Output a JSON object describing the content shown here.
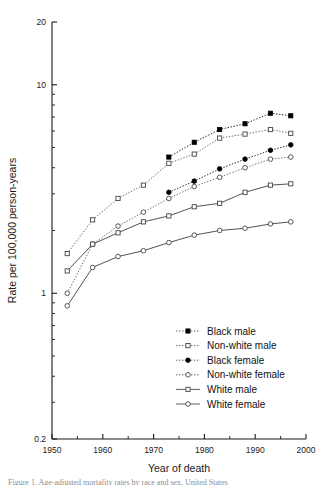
{
  "figure": {
    "caption_partial": "Figure 1. Age-adjusted mortality rates by race and sex, United States"
  },
  "chart_data": {
    "type": "line",
    "title": "",
    "xlabel": "Year of death",
    "ylabel": "Rate per 100,000 person-years",
    "yscale": "log",
    "xscale": "linear",
    "xlim": [
      1950,
      2000
    ],
    "ylim": [
      0.2,
      20
    ],
    "grid": false,
    "legend_position": "lower-right-inside",
    "xticks": [
      1950,
      1960,
      1970,
      1980,
      1990,
      2000
    ],
    "xtick_labels": [
      "1950",
      "1960",
      "1970",
      "1980",
      "1990",
      "2000"
    ],
    "xminor_ticks": [
      1955,
      1965,
      1975,
      1985,
      1995
    ],
    "yticks": [
      0.2,
      1,
      10,
      20
    ],
    "ytick_labels": [
      "0.2",
      "1",
      "10",
      "20"
    ],
    "yminor_ticks": [
      0.3,
      0.4,
      0.5,
      0.6,
      0.7,
      0.8,
      0.9,
      2,
      3,
      4,
      5,
      6,
      7,
      8,
      9
    ],
    "series": [
      {
        "name": "Black male",
        "marker": "filled-square",
        "line": "dotted",
        "color": "#000000",
        "x": [
          1973,
          1978,
          1983,
          1988,
          1993,
          1997
        ],
        "y": [
          4.5,
          5.3,
          6.1,
          6.5,
          7.3,
          7.1
        ]
      },
      {
        "name": "Non-white male",
        "marker": "open-square",
        "line": "dotted",
        "color": "#555555",
        "x": [
          1953,
          1958,
          1963,
          1968,
          1973,
          1978,
          1983,
          1988,
          1993,
          1997
        ],
        "y": [
          1.55,
          2.25,
          2.85,
          3.3,
          4.2,
          4.65,
          5.55,
          5.8,
          6.1,
          5.85
        ]
      },
      {
        "name": "Black female",
        "marker": "filled-circle",
        "line": "dotted",
        "color": "#000000",
        "x": [
          1973,
          1978,
          1983,
          1988,
          1993,
          1997
        ],
        "y": [
          3.05,
          3.45,
          3.95,
          4.4,
          4.85,
          5.15
        ]
      },
      {
        "name": "Non-white female",
        "marker": "open-circle",
        "line": "dotted",
        "color": "#555555",
        "x": [
          1953,
          1958,
          1963,
          1968,
          1973,
          1978,
          1983,
          1988,
          1993,
          1997
        ],
        "y": [
          1.0,
          1.72,
          2.1,
          2.45,
          2.85,
          3.25,
          3.6,
          4.0,
          4.4,
          4.5
        ]
      },
      {
        "name": "White male",
        "marker": "open-square",
        "line": "solid",
        "color": "#333333",
        "x": [
          1953,
          1958,
          1963,
          1968,
          1973,
          1978,
          1983,
          1988,
          1993,
          1997
        ],
        "y": [
          1.28,
          1.72,
          1.95,
          2.2,
          2.35,
          2.6,
          2.7,
          3.05,
          3.3,
          3.35
        ]
      },
      {
        "name": "White female",
        "marker": "open-circle",
        "line": "solid",
        "color": "#333333",
        "x": [
          1953,
          1958,
          1963,
          1968,
          1973,
          1978,
          1983,
          1988,
          1993,
          1997
        ],
        "y": [
          0.87,
          1.33,
          1.5,
          1.6,
          1.75,
          1.9,
          2.0,
          2.05,
          2.15,
          2.2
        ]
      }
    ],
    "legend_entries": [
      {
        "label": "Black male",
        "marker": "filled-square",
        "line": "dotted"
      },
      {
        "label": "Non-white male",
        "marker": "open-square",
        "line": "dotted"
      },
      {
        "label": "Black female",
        "marker": "filled-circle",
        "line": "dotted"
      },
      {
        "label": "Non-white female",
        "marker": "open-circle",
        "line": "dotted"
      },
      {
        "label": "White male",
        "marker": "open-square",
        "line": "solid"
      },
      {
        "label": "White female",
        "marker": "open-circle",
        "line": "solid"
      }
    ]
  }
}
